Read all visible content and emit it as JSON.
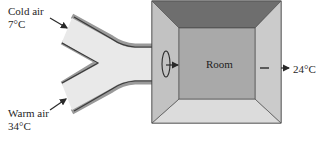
{
  "labels": {
    "cold_inlet": {
      "name": "Cold air",
      "temperature": "7°C"
    },
    "warm_inlet": {
      "name": "Warm air",
      "temperature": "34°C"
    },
    "room": "Room",
    "outlet_temperature": "24°C"
  },
  "colors": {
    "duct_fill": "#e9e9e9",
    "duct_edge_dark": "#3a3a3a",
    "duct_edge_shadow": "#9a9a9a",
    "room_outer_wall": "#c9c9c9",
    "room_ceiling": "#6e6e6e",
    "room_floor": "#dcdcdc",
    "room_back_wall": "#a9a9a9",
    "room_side_wall": "#c6c6c6",
    "stroke": "#2a2a2a"
  }
}
